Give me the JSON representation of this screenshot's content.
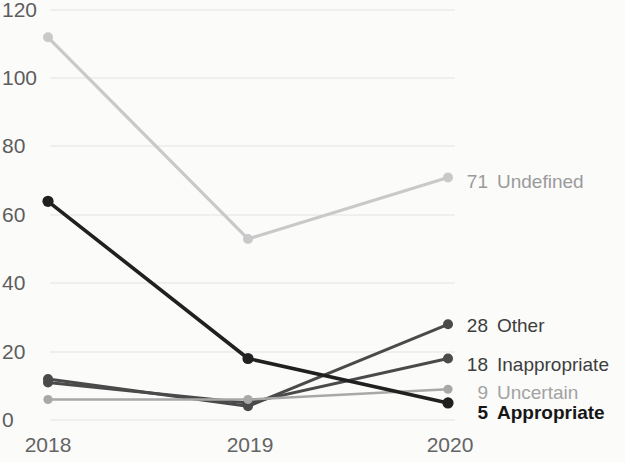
{
  "chart_data": {
    "type": "line",
    "title": "",
    "xlabel": "",
    "ylabel": "",
    "categories": [
      "2018",
      "2019",
      "2020"
    ],
    "x_tick_labels": [
      "2018",
      "2019",
      "2020"
    ],
    "y_tick_labels": [
      "0",
      "20",
      "40",
      "60",
      "80",
      "100",
      "120"
    ],
    "y_ticks": [
      0,
      20,
      40,
      60,
      80,
      100,
      120
    ],
    "ylim": [
      0,
      120
    ],
    "grid": true,
    "grid_axis": "y",
    "legend_position": "right-end-labels",
    "series": [
      {
        "name": "Undefined",
        "values": [
          112,
          53,
          71
        ],
        "end_value": "71",
        "color": "#c9c9c9"
      },
      {
        "name": "Other",
        "values": [
          12,
          4,
          28
        ],
        "end_value": "28",
        "color": "#4a4a4a"
      },
      {
        "name": "Inappropriate",
        "values": [
          11,
          5,
          18
        ],
        "end_value": "18",
        "color": "#4a4a4a"
      },
      {
        "name": "Uncertain",
        "values": [
          6,
          6,
          9
        ],
        "end_value": "9",
        "color": "#a8a8a8"
      },
      {
        "name": "Appropriate",
        "values": [
          64,
          18,
          5
        ],
        "end_value": "5",
        "color": "#202020"
      }
    ]
  },
  "labels": {
    "undefined_value": "71",
    "undefined_name": "Undefined",
    "other_value": "28",
    "other_name": "Other",
    "inappropriate_value": "18",
    "inappropriate_name": "Inappropriate",
    "uncertain_value": "9",
    "uncertain_name": "Uncertain",
    "appropriate_value": "5",
    "appropriate_name": "Appropriate"
  },
  "axis": {
    "y_0": "0",
    "y_20": "20",
    "y_40": "40",
    "y_60": "60",
    "y_80": "80",
    "y_100": "100",
    "y_120": "120",
    "x_2018": "2018",
    "x_2019": "2019",
    "x_2020": "2020"
  },
  "colors": {
    "background": "#fbfbfa",
    "gridline": "#e3e3e1",
    "dark_series": "#4a4a4a",
    "darkest_series": "#202020",
    "light_series": "#c9c9c9",
    "mid_series": "#a8a8a8",
    "tick_text": "#5d5d5d"
  }
}
